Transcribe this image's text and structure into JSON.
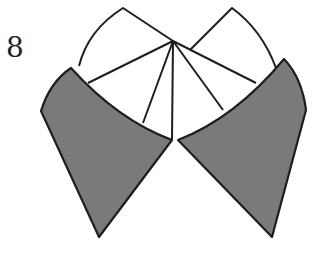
{
  "step": {
    "number": "8"
  },
  "diagram": {
    "colors": {
      "shade": "#7a7a7a",
      "line": "#1e1e1e",
      "paper": "#ffffff"
    }
  }
}
